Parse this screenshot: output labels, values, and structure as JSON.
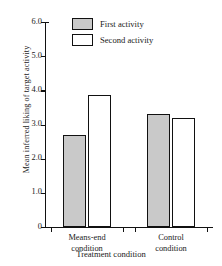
{
  "chart_data": {
    "type": "bar",
    "title": "",
    "xlabel": "Treatment condition",
    "ylabel": "Mean inferred liking of target activity",
    "categories": [
      "Means-end condition",
      "Control condition"
    ],
    "category_lines": [
      [
        "Means-end",
        "condition"
      ],
      [
        "Control",
        "condition"
      ]
    ],
    "series": [
      {
        "name": "First activity",
        "values": [
          2.7,
          3.3
        ],
        "color": "#c9c9c9"
      },
      {
        "name": "Second activity",
        "values": [
          3.85,
          3.2
        ],
        "color": "#ffffff"
      }
    ],
    "ylim": [
      0,
      6.0
    ],
    "yticks": [
      0,
      1.0,
      2.0,
      3.0,
      4.0,
      5.0,
      6.0
    ],
    "ytick_labels": [
      "0",
      "1.0",
      "2.0",
      "3.0",
      "4.0",
      "5.0",
      "6.0"
    ],
    "grid": false,
    "legend_position": "top-center",
    "legend": [
      "First activity",
      "Second activity"
    ]
  },
  "legend": {
    "first_label": "First activity",
    "second_label": "Second activity"
  },
  "axes": {
    "y_title": "Mean inferred liking of target activity",
    "x_title": "Treatment condition"
  },
  "colors": {
    "first_activity_fill": "#c9c9c9",
    "second_activity_fill": "#ffffff",
    "axis": "#111111"
  }
}
